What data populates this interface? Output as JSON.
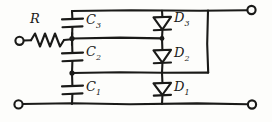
{
  "diagram": {
    "type": "electrical-schematic",
    "style": "hand-drawn",
    "ink_color": "#1a1a18",
    "background_color": "#fdfdfb",
    "labels": {
      "resistor": "R",
      "capacitor_top": "C",
      "capacitor_top_sub": "3",
      "capacitor_middle": "C",
      "capacitor_middle_sub": "2",
      "capacitor_bottom": "C",
      "capacitor_bottom_sub": "1",
      "diode_top": "D",
      "diode_top_sub": "3",
      "diode_middle": "D",
      "diode_middle_sub": "2",
      "diode_bottom": "D",
      "diode_bottom_sub": "1"
    },
    "components": [
      {
        "name": "resistor-R",
        "kind": "resistor",
        "label": "R"
      },
      {
        "name": "capacitor-C3",
        "kind": "capacitor",
        "label": "C3"
      },
      {
        "name": "capacitor-C2",
        "kind": "capacitor",
        "label": "C2"
      },
      {
        "name": "capacitor-C1",
        "kind": "capacitor",
        "label": "C1"
      },
      {
        "name": "diode-D3",
        "kind": "diode",
        "label": "D3",
        "orientation": "cathode-down"
      },
      {
        "name": "diode-D2",
        "kind": "diode",
        "label": "D2",
        "orientation": "cathode-down"
      },
      {
        "name": "diode-D1",
        "kind": "diode",
        "label": "D1",
        "orientation": "cathode-down"
      }
    ],
    "terminals": [
      {
        "name": "terminal-input-left",
        "position": "left-upper"
      },
      {
        "name": "terminal-input-bottom-left",
        "position": "left-lower"
      },
      {
        "name": "terminal-output-top-right",
        "position": "right-upper"
      },
      {
        "name": "terminal-output-bottom-right",
        "position": "right-lower"
      }
    ],
    "nodes": [
      {
        "name": "node-capacitor-upper",
        "description": "junction between C3 and C2"
      },
      {
        "name": "node-capacitor-lower",
        "description": "junction between C2 and C1"
      },
      {
        "name": "node-diode-upper",
        "description": "junction between D3 and D2"
      }
    ]
  }
}
